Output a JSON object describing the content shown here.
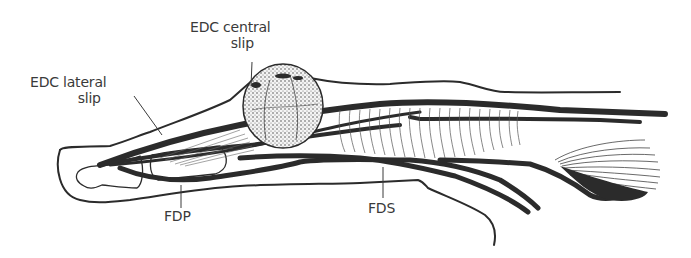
{
  "figure": {
    "ink_color": "#2b2b2b",
    "text_color": "#3a3a3a",
    "background": "#ffffff"
  },
  "labels": {
    "edc_central": {
      "line1": "EDC central",
      "line2": "slip"
    },
    "edc_lateral": {
      "line1": "EDC lateral",
      "line2": "slip"
    },
    "fdp": {
      "text": "FDP"
    },
    "fds": {
      "text": "FDS"
    }
  }
}
